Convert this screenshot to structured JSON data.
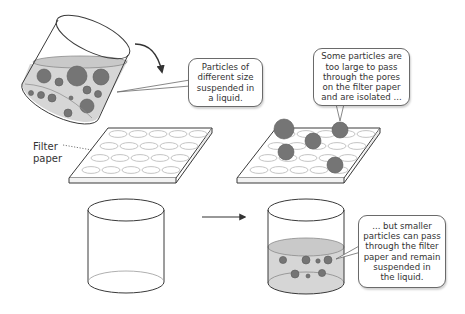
{
  "diagram": {
    "colors": {
      "liquid": "#d6d6d6",
      "particle": "#757575",
      "particle_edge": "#5a5a5a",
      "outline": "#3a3a3a",
      "pore": "#bdbdbd"
    },
    "labels": {
      "filter_paper": "Filter\npaper"
    },
    "callouts": [
      {
        "id": "mixture",
        "text": "Particles of\ndifferent size\nsuspended in\na liquid."
      },
      {
        "id": "retained",
        "text": "Some particles are\ntoo large to pass\nthrough the pores\non the filter paper\nand are isolated ..."
      },
      {
        "id": "filtrate",
        "text": "... but smaller\nparticles can pass\nthrough the filter\npaper and remain\nsuspended in\nthe liquid."
      }
    ],
    "stages": [
      {
        "name": "tilted-beaker-with-mixture",
        "icon": "beaker-icon"
      },
      {
        "name": "pour-arrow",
        "icon": "curved-arrow-icon"
      },
      {
        "name": "empty-filter-paper",
        "icon": "filter-paper-icon"
      },
      {
        "name": "filter-paper-with-large-particles",
        "icon": "filter-paper-icon"
      },
      {
        "name": "empty-beaker",
        "icon": "beaker-icon"
      },
      {
        "name": "process-arrow",
        "icon": "arrow-right-icon"
      },
      {
        "name": "beaker-with-filtrate",
        "icon": "beaker-icon"
      }
    ]
  }
}
